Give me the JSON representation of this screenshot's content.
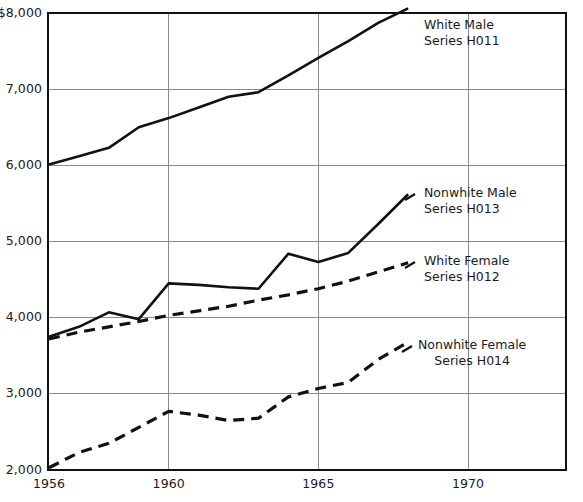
{
  "chart_data": {
    "type": "line",
    "title": "",
    "subtitle": "",
    "xlabel": "",
    "ylabel": "",
    "xlim": [
      1956,
      1971
    ],
    "ylim": [
      2000,
      8100
    ],
    "grid": true,
    "legend_position": "inline-right",
    "x": [
      1956,
      1957,
      1958,
      1959,
      1960,
      1961,
      1962,
      1963,
      1964,
      1965,
      1966,
      1967,
      1968
    ],
    "x_tick_values": [
      1956,
      1960,
      1965,
      1970
    ],
    "x_tick_labels": [
      "1956",
      "1960",
      "1965",
      "1970"
    ],
    "y_tick_values": [
      2000,
      3000,
      4000,
      5000,
      6000,
      7000,
      8000
    ],
    "y_tick_labels": [
      "2,000",
      "3,000",
      "4,000",
      "5,000",
      "6,000",
      "7,000",
      "$8,000"
    ],
    "series": [
      {
        "name": "White Male",
        "code": "Series H011",
        "style": "solid",
        "color": "#111111",
        "values": [
          6010,
          6120,
          6230,
          6500,
          6620,
          6760,
          6900,
          6960,
          7180,
          7410,
          7630,
          7870,
          8060
        ],
        "annotation": {
          "line1": "White Male",
          "line2": "Series H011"
        }
      },
      {
        "name": "Nonwhite Male",
        "code": "Series H013",
        "style": "solid",
        "color": "#111111",
        "values": [
          3750,
          3880,
          4070,
          3980,
          4450,
          4430,
          4400,
          4380,
          4840,
          4730,
          4850,
          5230,
          5620
        ],
        "annotation": {
          "line1": "Nonwhite Male",
          "line2": "Series H013"
        }
      },
      {
        "name": "White Female",
        "code": "Series H012",
        "style": "dashed",
        "color": "#111111",
        "values": [
          3720,
          3810,
          3880,
          3950,
          4030,
          4090,
          4150,
          4230,
          4300,
          4380,
          4480,
          4600,
          4720
        ],
        "annotation": {
          "line1": "White Female",
          "line2": "Series H012"
        }
      },
      {
        "name": "Nonwhite Female",
        "code": "Series H014",
        "style": "dashed",
        "color": "#111111",
        "values": [
          2030,
          2230,
          2350,
          2560,
          2770,
          2720,
          2650,
          2680,
          2960,
          3070,
          3150,
          3450,
          3680
        ],
        "annotation": {
          "line1": "Nonwhite Female",
          "line2": "Series H014"
        }
      }
    ]
  },
  "axis": {
    "frame_color": "#111111",
    "grid_color": "#8a8a8a"
  }
}
